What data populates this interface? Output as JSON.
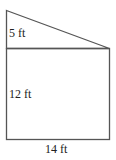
{
  "diagram": {
    "type": "composite-shape",
    "stroke_color": "#555555",
    "labels": {
      "triangle_height": "5 ft",
      "rectangle_height": "12 ft",
      "base_width": "14 ft"
    },
    "dimensions": {
      "triangle_height_ft": 5,
      "rectangle_height_ft": 12,
      "base_width_ft": 14
    }
  }
}
